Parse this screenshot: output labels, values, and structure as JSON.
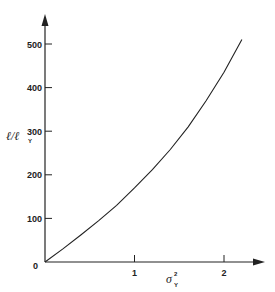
{
  "chart_data": {
    "type": "line",
    "title": "",
    "xlabel": "σ_Y²",
    "ylabel": "ℓ/ℓ_Y",
    "xlim": [
      0,
      2.4
    ],
    "ylim": [
      0,
      560
    ],
    "x_ticks": [
      0,
      1,
      2
    ],
    "x_tick_labels": [
      "",
      "1",
      "2"
    ],
    "y_ticks": [
      0,
      100,
      200,
      300,
      400,
      500
    ],
    "y_tick_labels": [
      "0",
      "100",
      "200",
      "300",
      "400",
      "500"
    ],
    "grid": false,
    "legend": null,
    "series": [
      {
        "name": "ℓ/ℓ_Y vs σ_Y²",
        "x": [
          0,
          0.2,
          0.4,
          0.6,
          0.8,
          1.0,
          1.2,
          1.4,
          1.6,
          1.8,
          2.0,
          2.2
        ],
        "y": [
          0,
          30,
          62,
          95,
          130,
          170,
          212,
          258,
          310,
          370,
          435,
          510
        ]
      }
    ]
  },
  "axes": {
    "origin_label": "0",
    "x_label_main": "σ",
    "x_label_sup": "2",
    "x_label_sub": "Y",
    "y_label_main": "ℓ/ℓ",
    "y_label_sub": "Y"
  }
}
